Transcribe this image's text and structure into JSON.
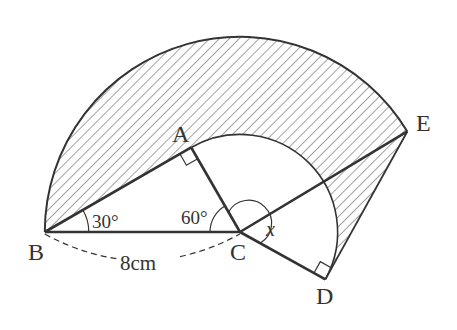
{
  "figure": {
    "points": {
      "A": "A",
      "B": "B",
      "C": "C",
      "D": "D",
      "E": "E"
    },
    "angle_labels": {
      "angle_B": "30°",
      "angle_C": "60°",
      "angle_x": "x"
    },
    "length_label": "8cm",
    "given": {
      "BC_cm": 8,
      "angle_ABC_deg": 30,
      "angle_ACB_deg": 60,
      "right_angles": [
        "A",
        "D"
      ]
    },
    "colors": {
      "stroke": "#333333",
      "hatch": "#555555",
      "background": "#ffffff"
    }
  }
}
